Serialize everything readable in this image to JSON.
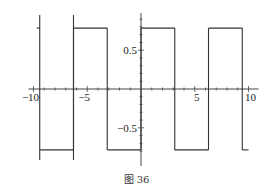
{
  "chart_data": {
    "type": "line",
    "title": "",
    "xlabel": "",
    "ylabel": "",
    "xlim": [
      -10,
      10
    ],
    "ylim": [
      -0.85,
      0.95
    ],
    "grid": false,
    "x_ticks": [
      -10,
      -5,
      5,
      10
    ],
    "x_tick_labels": [
      "-10",
      "-5",
      "5",
      "10"
    ],
    "y_ticks": [
      0.5,
      -0.5
    ],
    "y_tick_labels": [
      "0.5",
      "-0.5"
    ],
    "series": [
      {
        "name": "square wave",
        "description": "Square wave of amplitude pi/4 and period 2pi; +pi/4 on (2k*pi,(2k+1)*pi), -pi/4 otherwise",
        "amplitude": 0.785,
        "period": 6.283,
        "segments": [
          {
            "x": [
              -9.42,
              -6.28
            ],
            "y": -0.785
          },
          {
            "x": [
              -6.28,
              -3.14
            ],
            "y": 0.785
          },
          {
            "x": [
              -3.14,
              0
            ],
            "y": -0.785
          },
          {
            "x": [
              0,
              3.14
            ],
            "y": 0.785
          },
          {
            "x": [
              3.14,
              6.28
            ],
            "y": -0.785
          },
          {
            "x": [
              6.28,
              9.42
            ],
            "y": 0.785
          },
          {
            "x": [
              9.42,
              10
            ],
            "y": -0.785
          }
        ],
        "color": "#333333"
      }
    ]
  },
  "caption": "图 36"
}
